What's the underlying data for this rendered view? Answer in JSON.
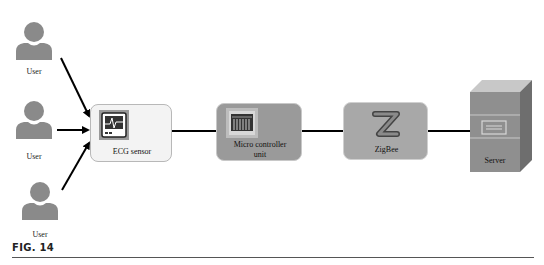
{
  "figure": {
    "label": "FIG. 14"
  },
  "users": [
    {
      "label": "User"
    },
    {
      "label": "User"
    },
    {
      "label": "User"
    }
  ],
  "nodes": {
    "ecg_sensor": {
      "label": "ECG sensor",
      "icon": "ecg-monitor-icon",
      "fill": "#f2f2f2",
      "border": "#b5b5b5"
    },
    "mcu": {
      "label_line1": "Micro controller",
      "label_line2": "unit",
      "icon": "circuit-board-icon",
      "fill": "#9a9a9a",
      "border": "#c8c8c8"
    },
    "zigbee": {
      "label": "ZigBee",
      "icon": "zigbee-z-icon",
      "fill": "#a8a8a8",
      "border": "#d0d0d0"
    },
    "server": {
      "label": "Server",
      "icon": "server-tower-icon",
      "fill": "#8f8f8f"
    }
  },
  "colors": {
    "user_icon": "#8a8a8a",
    "line": "#000000"
  }
}
